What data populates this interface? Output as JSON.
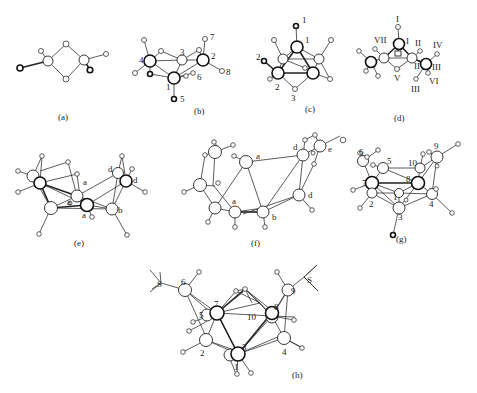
{
  "figure": {
    "panels": [
      {
        "id": "a",
        "caption": "(a)",
        "labels": []
      },
      {
        "id": "b",
        "caption": "(b)",
        "labels": [
          "1",
          "2",
          "3",
          "4",
          "5",
          "6",
          "7",
          "8"
        ]
      },
      {
        "id": "c",
        "caption": "(c)",
        "labels": [
          "1",
          "1",
          "2",
          "2",
          "3"
        ]
      },
      {
        "id": "d",
        "caption": "(d)",
        "labels": [
          "I",
          "I",
          "VII",
          "II",
          "II",
          "III",
          "III",
          "IV",
          "V",
          "VI"
        ]
      },
      {
        "id": "e",
        "caption": "(e)",
        "labels": [
          "a",
          "a",
          "a",
          "b",
          "d",
          "d"
        ]
      },
      {
        "id": "f",
        "caption": "(f)",
        "labels": [
          "a",
          "a",
          "b",
          "d",
          "d",
          "e"
        ]
      },
      {
        "id": "g",
        "caption": "(g)",
        "labels": [
          "1",
          "2",
          "3",
          "4",
          "5",
          "6",
          "7",
          "8",
          "9",
          "10"
        ]
      },
      {
        "id": "h",
        "caption": "(h)",
        "labels": [
          "1",
          "2",
          "3",
          "4",
          "5",
          "6",
          "7",
          "8",
          "9",
          "10",
          "S",
          "S"
        ]
      }
    ]
  },
  "text": {
    "cap_a": "(a)",
    "cap_b": "(b)",
    "cap_c": "(c)",
    "cap_d": "(d)",
    "cap_e": "(e)",
    "cap_f": "(f)",
    "cap_g": "(g)",
    "cap_h": "(h)",
    "b1": "1",
    "b2": "2",
    "b3": "3",
    "b4": "4",
    "b5": "5",
    "b6": "6",
    "b7": "7",
    "b8": "8",
    "c1top": "1",
    "c1": "1",
    "c2left": "2",
    "c2": "2",
    "c3": "3",
    "dItop": "I",
    "dI": "I",
    "dVII": "VII",
    "dIIa": "II",
    "dII": "II",
    "dIV": "IV",
    "dIII": "III",
    "dIIIb": "III",
    "dV": "V",
    "dVI": "VI",
    "ea1": "a",
    "ea2": "a",
    "ea3": "a",
    "eb": "b",
    "ed1": "d",
    "ed2": "d",
    "fa1": "a",
    "fa2": "a",
    "fb": "b",
    "fd1": "d",
    "fd2": "d",
    "fe": "e",
    "g1": "1",
    "g2": "2",
    "g3": "3",
    "g4": "4",
    "g5": "5",
    "g6": "6",
    "g7": "7",
    "g8": "8",
    "g9": "9",
    "g10": "10",
    "h1": "1",
    "h2": "2",
    "h3": "3",
    "h4": "4",
    "h5": "5",
    "h6": "6",
    "h7": "7",
    "h8": "8",
    "h9": "9",
    "h10": "10",
    "hS1": "S",
    "hS2": "S"
  }
}
